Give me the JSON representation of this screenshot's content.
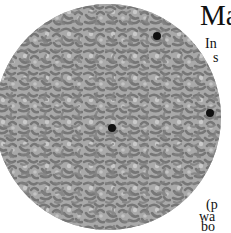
{
  "figure": {
    "type": "circular-micrograph",
    "colors": {
      "background": "#a9a9a9",
      "cells": "#7c7c7c",
      "highlight": "#cfcfcf",
      "inclusion": "#101010"
    },
    "dark_spots": [
      {
        "x": 157,
        "y": 36,
        "r": 4
      },
      {
        "x": 112,
        "y": 128,
        "r": 4
      },
      {
        "x": 210,
        "y": 113,
        "r": 4
      }
    ]
  },
  "text": {
    "title_fragment": "Ma",
    "lines": [
      "In",
      "s",
      "(p",
      "wa",
      "bo",
      "co"
    ]
  }
}
